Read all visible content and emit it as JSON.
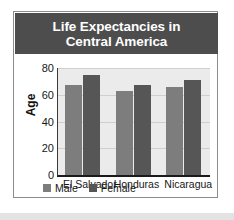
{
  "chart_data": {
    "type": "bar",
    "title": "Life Expectancies in\nCentral America",
    "title_line1": "Life Expectancies in",
    "title_line2": "Central America",
    "xlabel": "",
    "ylabel": "Age",
    "ylim": [
      0,
      80
    ],
    "yticks": [
      0,
      20,
      40,
      60,
      80
    ],
    "ytick_labels": [
      "0",
      "20",
      "40",
      "60",
      "80"
    ],
    "grid": true,
    "legend_position": "bottom-left",
    "categories": [
      "El Salvador",
      "Honduras",
      "Nicaragua"
    ],
    "series": [
      {
        "name": "Male",
        "color": "#7d7d7d",
        "values": [
          67,
          63,
          66
        ]
      },
      {
        "name": "Female",
        "color": "#565656",
        "values": [
          75,
          67,
          71
        ]
      }
    ]
  },
  "style": {
    "title_banner_color": "#4d4d4d",
    "title_text_color": "#ffffff",
    "plot_background": "#ebebeb",
    "gridline_color": "#cfcfcf",
    "axis_color": "#1a1a1a",
    "card_border_color": "#8c8c8c",
    "page_background": "#ffffff",
    "bottom_strip_color": "#e3e3e3"
  }
}
